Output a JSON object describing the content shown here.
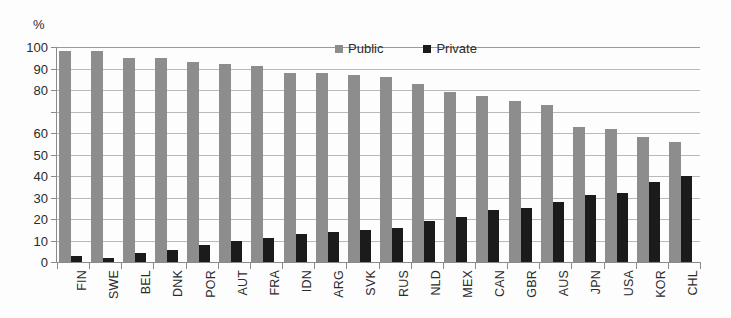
{
  "chart_data": {
    "type": "bar",
    "title": "",
    "subtitle": "",
    "xlabel": "",
    "ylabel": "%",
    "unit_label": "%",
    "ylim": [
      0,
      100
    ],
    "ytick_step": 10,
    "grid": true,
    "grid_axis": "y",
    "legend_position": "top-center",
    "orientation": "vertical",
    "bar_mode": "grouped",
    "categories": [
      "FIN",
      "SWE",
      "BEL",
      "DNK",
      "POR",
      "AUT",
      "FRA",
      "IDN",
      "ARG",
      "SVK",
      "RUS",
      "NLD",
      "MEX",
      "CAN",
      "GBR",
      "AUS",
      "JPN",
      "USA",
      "KOR",
      "CHL"
    ],
    "ytick_labels": [
      "100",
      "90",
      "80",
      "",
      "60",
      "50",
      "40",
      "30",
      "20",
      "10",
      "0"
    ],
    "ytick_values": [
      100,
      90,
      80,
      70,
      60,
      50,
      40,
      30,
      20,
      10,
      0
    ],
    "series": [
      {
        "name": "Public",
        "color": "#8d8d8d",
        "values": [
          98,
          98,
          95,
          95,
          93,
          92,
          91,
          88,
          88,
          87,
          86,
          83,
          79,
          77,
          75,
          73,
          63,
          62,
          58,
          56
        ]
      },
      {
        "name": "Private",
        "color": "#1b1b1b",
        "values": [
          3,
          2,
          4,
          5.5,
          8,
          10,
          11,
          13,
          14,
          15,
          16,
          19,
          21,
          24,
          25,
          28,
          31,
          32,
          37,
          40
        ]
      }
    ]
  },
  "legend": {
    "items": [
      {
        "label": "Public",
        "color": "#8d8d8d",
        "swatch": "square-swatch"
      },
      {
        "label": "Private",
        "color": "#1b1b1b",
        "swatch": "square-swatch"
      }
    ]
  },
  "axes": {
    "y": {
      "unit": "%",
      "min": 0,
      "max": 100
    }
  },
  "colors": {
    "public": "#8d8d8d",
    "private": "#1b1b1b",
    "gridline": "#b9b9b9",
    "axis": "#8a8a8a",
    "text": "#2b2b2b",
    "background": "#fdfdfd"
  }
}
